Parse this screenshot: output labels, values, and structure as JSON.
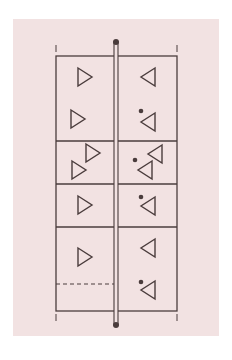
{
  "diagram": {
    "type": "court-formation",
    "colors": {
      "background": "#f2e2e2",
      "line": "#4a3c3c",
      "page": "#ffffff"
    },
    "court": {
      "left": 56,
      "right": 177,
      "top": 56,
      "bottom": 311
    },
    "net": {
      "x": 116,
      "top": 42,
      "bottom": 325
    },
    "zone_lines_y": [
      141,
      184,
      227
    ],
    "dashed_line": {
      "x1": 56,
      "x2": 114,
      "y": 284
    },
    "end_marks": [
      {
        "x": 56,
        "y1": 45,
        "y2": 52
      },
      {
        "x": 177,
        "y1": 45,
        "y2": 52
      },
      {
        "x": 56,
        "y1": 314,
        "y2": 321
      },
      {
        "x": 177,
        "y1": 314,
        "y2": 321
      }
    ],
    "left_team": {
      "label": "players-facing-right",
      "players": [
        {
          "x": 85,
          "y": 77
        },
        {
          "x": 78,
          "y": 119
        },
        {
          "x": 93,
          "y": 153
        },
        {
          "x": 79,
          "y": 170
        },
        {
          "x": 85,
          "y": 205
        },
        {
          "x": 85,
          "y": 257
        }
      ]
    },
    "right_team": {
      "label": "players-facing-left",
      "players": [
        {
          "x": 148,
          "y": 77
        },
        {
          "x": 148,
          "y": 122
        },
        {
          "x": 155,
          "y": 154
        },
        {
          "x": 145,
          "y": 170
        },
        {
          "x": 148,
          "y": 206
        },
        {
          "x": 148,
          "y": 248
        },
        {
          "x": 148,
          "y": 290
        }
      ]
    },
    "balls": [
      {
        "x": 141,
        "y": 111
      },
      {
        "x": 135,
        "y": 160
      },
      {
        "x": 141,
        "y": 197
      },
      {
        "x": 141,
        "y": 282
      }
    ]
  }
}
